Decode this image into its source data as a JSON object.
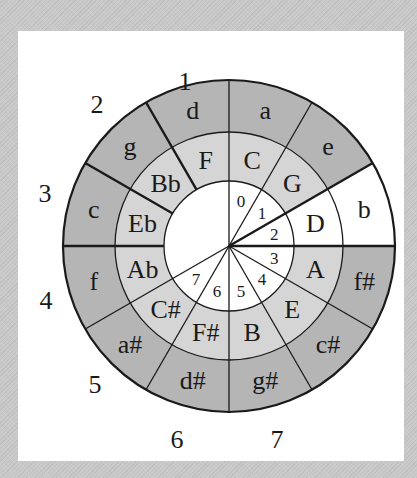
{
  "diagram": {
    "center": [
      229,
      246
    ],
    "radii": {
      "inner": 65,
      "middle": 114,
      "outer": 166
    },
    "colors": {
      "major_ring": "#d5d5d5",
      "minor_ring": "#b5b5b5",
      "highlight": "#ffffff",
      "inner": "#ffffff",
      "line": "#1a1a1a"
    },
    "major_keys": [
      "C",
      "G",
      "D",
      "A",
      "E",
      "B",
      "F#",
      "C#",
      "Ab",
      "Eb",
      "Bb",
      "F"
    ],
    "minor_keys": [
      "a",
      "e",
      "b",
      "f#",
      "c#",
      "g#",
      "d#",
      "a#",
      "f",
      "c",
      "g",
      "d"
    ],
    "highlighted_sector": 2,
    "inner_numbers": [
      "0",
      "1",
      "2",
      "3",
      "4",
      "5",
      "6",
      "7"
    ],
    "outer_numbers": [
      {
        "label": "1",
        "x": 185,
        "y": 90
      },
      {
        "label": "2",
        "x": 97,
        "y": 113
      },
      {
        "label": "3",
        "x": 45,
        "y": 202
      },
      {
        "label": "4",
        "x": 46,
        "y": 309
      },
      {
        "label": "5",
        "x": 95,
        "y": 393
      },
      {
        "label": "6",
        "x": 177,
        "y": 448
      },
      {
        "label": "7",
        "x": 277,
        "y": 448
      }
    ]
  }
}
